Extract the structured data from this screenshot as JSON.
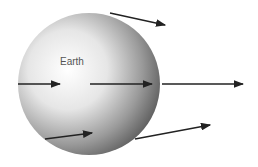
{
  "diagram": {
    "earth_label": "Earth",
    "arrows": [
      {
        "x1": 110,
        "y1": 13,
        "x2": 165,
        "y2": 25
      },
      {
        "x1": 18,
        "y1": 84,
        "x2": 60,
        "y2": 84
      },
      {
        "x1": 90,
        "y1": 84,
        "x2": 152,
        "y2": 84
      },
      {
        "x1": 162,
        "y1": 84,
        "x2": 243,
        "y2": 84
      },
      {
        "x1": 45,
        "y1": 139,
        "x2": 92,
        "y2": 133
      },
      {
        "x1": 135,
        "y1": 139,
        "x2": 210,
        "y2": 125
      }
    ]
  }
}
